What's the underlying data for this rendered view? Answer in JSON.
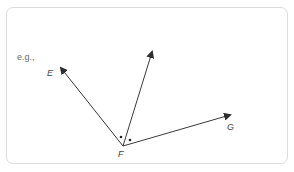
{
  "example_label": "e.g.,",
  "diagram": {
    "vertex": {
      "label": "F",
      "x": 123,
      "y": 146
    },
    "rays": [
      {
        "name": "E",
        "label": "E",
        "tip": {
          "x": 59,
          "y": 66
        }
      },
      {
        "name": "bisector",
        "label": "",
        "tip": {
          "x": 153,
          "y": 49
        }
      },
      {
        "name": "G",
        "label": "G",
        "tip": {
          "x": 233,
          "y": 114
        }
      }
    ],
    "angle_marks": [
      "dot",
      "dot"
    ]
  },
  "colors": {
    "stroke": "#3a3a3a",
    "border": "#dcdcdc"
  }
}
